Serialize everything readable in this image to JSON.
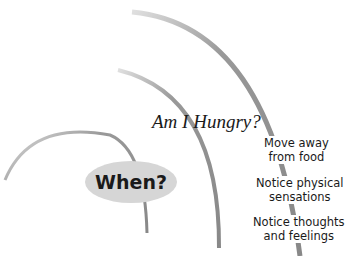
{
  "diagram": {
    "center_label": "When?",
    "arc_title": "Am I Hungry?",
    "steps": [
      {
        "line1": "Move away",
        "line2": "from food"
      },
      {
        "line1": "Notice physical",
        "line2": "sensations"
      },
      {
        "line1": "Notice thoughts",
        "line2": "and feelings"
      }
    ],
    "colors": {
      "arc": "#8c8c8c",
      "ellipse_fill": "#d6d6d6",
      "text": "#1a1a1a"
    }
  }
}
